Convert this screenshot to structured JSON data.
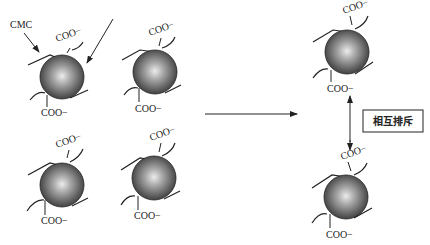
{
  "diagram": {
    "labels": {
      "cmc": "CMC",
      "coo": "COO−",
      "repulsion": "相互排斥"
    },
    "particles_left": [
      {
        "id": "p1",
        "cx": 68,
        "cy": 80
      },
      {
        "id": "p2",
        "cx": 161,
        "cy": 73
      },
      {
        "id": "p3",
        "cx": 62,
        "cy": 185
      },
      {
        "id": "p4",
        "cx": 154,
        "cy": 178
      }
    ],
    "particles_right": [
      {
        "id": "p5",
        "cx": 346,
        "cy": 52
      },
      {
        "id": "p6",
        "cx": 345,
        "cy": 196
      }
    ],
    "colors": {
      "particle_dark": "#3a3a3a",
      "particle_light": "#e6e6e6",
      "line": "#222222"
    }
  }
}
